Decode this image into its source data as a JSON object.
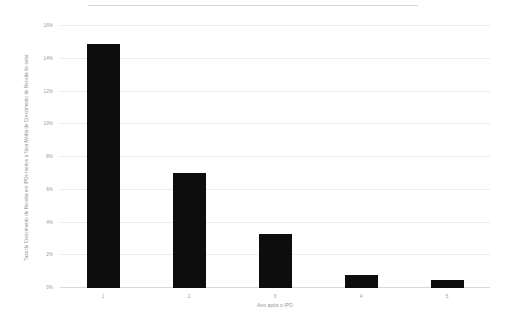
{
  "chart_data": {
    "type": "bar",
    "title": "",
    "subtitle": "",
    "categories": [
      "1",
      "2",
      "3",
      "4",
      "5"
    ],
    "values": [
      14.9,
      7.0,
      3.3,
      0.8,
      0.5
    ],
    "series": [
      {
        "name": "Taxa de Crescimento de Receita em IPOs menos a Taxa Média de Crescimento de Receita do setor",
        "values": [
          14.9,
          7.0,
          3.3,
          0.8,
          0.5
        ]
      }
    ],
    "xlabel": "Ano após o IPO",
    "ylabel": "Taxa de Crescimento de Receita em IPOs menos a Taxa Média de Crescimento de Receita do setor",
    "ylim": [
      0,
      16
    ],
    "ytick_values": [
      0,
      2,
      4,
      6,
      8,
      10,
      12,
      14,
      16
    ],
    "ytick_labels": [
      "0%",
      "2%",
      "4%",
      "6%",
      "8%",
      "10%",
      "12%",
      "14%",
      "16%"
    ],
    "xtick_labels": [
      "1",
      "2",
      "3",
      "4",
      "5"
    ],
    "value_suffix": "%",
    "grid": true,
    "legend": false,
    "legend_position": "none",
    "bar_color": "#0d0d0d",
    "gridline_color": "#ececec",
    "axis_text_color": "#9a9a9a",
    "background_color": "#ffffff"
  }
}
